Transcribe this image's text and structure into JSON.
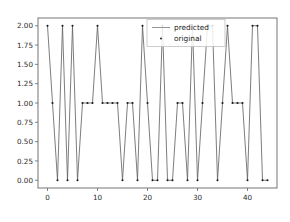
{
  "chart_data": {
    "type": "line",
    "title": "",
    "xlabel": "",
    "ylabel": "",
    "xlim": [
      -1.9,
      45.9
    ],
    "ylim": [
      -0.1,
      2.1
    ],
    "grid": false,
    "legend_position": "upper center",
    "x": [
      0,
      1,
      2,
      3,
      4,
      5,
      6,
      7,
      8,
      9,
      10,
      11,
      12,
      13,
      14,
      15,
      16,
      17,
      18,
      19,
      20,
      21,
      22,
      23,
      24,
      25,
      26,
      27,
      28,
      29,
      30,
      31,
      32,
      33,
      34,
      35,
      36,
      37,
      38,
      39,
      40,
      41,
      42,
      43,
      44
    ],
    "series": [
      {
        "name": "predicted",
        "style": "line",
        "color": "#555555",
        "values": [
          2,
          1,
          0,
          2,
          0,
          2,
          0,
          1,
          1,
          1,
          2,
          1,
          1,
          1,
          1,
          0,
          1,
          1,
          0,
          2,
          1,
          0,
          0,
          2,
          0,
          0,
          1,
          1,
          0,
          2,
          0,
          1,
          2,
          2,
          0,
          1,
          2,
          1,
          1,
          1,
          0,
          2,
          2,
          0,
          0
        ]
      },
      {
        "name": "original",
        "style": "scatter",
        "color": "#1a1a1a",
        "values": [
          2,
          1,
          0,
          2,
          0,
          2,
          0,
          1,
          1,
          1,
          2,
          1,
          1,
          1,
          1,
          0,
          1,
          1,
          0,
          2,
          1,
          0,
          0,
          2,
          0,
          0,
          1,
          1,
          0,
          2,
          0,
          1,
          2,
          2,
          0,
          1,
          2,
          1,
          1,
          1,
          0,
          2,
          2,
          0,
          0
        ]
      }
    ],
    "xticks": [
      0,
      10,
      20,
      30,
      40
    ],
    "xtick_labels": [
      "0",
      "10",
      "20",
      "30",
      "40"
    ],
    "yticks": [
      0.0,
      0.25,
      0.5,
      0.75,
      1.0,
      1.25,
      1.5,
      1.75,
      2.0
    ],
    "ytick_labels": [
      "0.00",
      "0.25",
      "0.50",
      "0.75",
      "1.00",
      "1.25",
      "1.50",
      "1.75",
      "2.00"
    ],
    "legend": [
      {
        "label": "predicted",
        "marker": "line",
        "color": "#777777"
      },
      {
        "label": "original",
        "marker": "dot",
        "color": "#1a1a1a"
      }
    ]
  },
  "figure": {
    "background": "#ffffff",
    "axes_edge_color": "#666666",
    "tick_color": "#2b2b2b"
  }
}
